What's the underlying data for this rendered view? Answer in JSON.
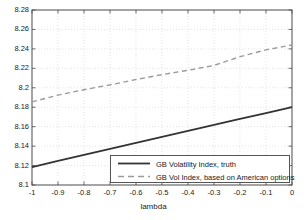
{
  "chart_data": {
    "type": "line",
    "title": "",
    "xlabel": "lambda",
    "ylabel": "",
    "xlim": [
      -1,
      0
    ],
    "ylim": [
      8.1,
      8.28
    ],
    "grid": true,
    "grid_style": "dotted",
    "legend_position": "bottom-right",
    "xticks": [
      "-1",
      "-0.9",
      "-0.8",
      "-0.7",
      "-0.6",
      "-0.5",
      "-0.4",
      "-0.3",
      "-0.2",
      "-0.1",
      "0"
    ],
    "xtick_values": [
      -1,
      -0.9,
      -0.8,
      -0.7,
      -0.6,
      -0.5,
      -0.4,
      -0.3,
      -0.2,
      -0.1,
      0
    ],
    "yticks": [
      "8.1",
      "8.12",
      "8.14",
      "8.16",
      "8.18",
      "8.2",
      "8.22",
      "8.24",
      "8.26",
      "8.28"
    ],
    "ytick_values": [
      8.1,
      8.12,
      8.14,
      8.16,
      8.18,
      8.2,
      8.22,
      8.24,
      8.26,
      8.28
    ],
    "x": [
      -1,
      -0.9,
      -0.8,
      -0.7,
      -0.6,
      -0.5,
      -0.4,
      -0.3,
      -0.2,
      -0.1,
      0
    ],
    "series": [
      {
        "name": "GB Volatility Index, truth",
        "style": "solid",
        "color": "#333333",
        "width": 1.8,
        "values": [
          8.1185,
          8.1247,
          8.1309,
          8.1371,
          8.1433,
          8.1495,
          8.1556,
          8.1618,
          8.1679,
          8.174,
          8.18
        ]
      },
      {
        "name": "GB Vol Index, based on American options",
        "style": "dashed",
        "color": "#9a9a9a",
        "width": 1.4,
        "values": [
          8.1855,
          8.1925,
          8.198,
          8.203,
          8.2085,
          8.2135,
          8.218,
          8.223,
          8.232,
          8.239,
          8.244
        ]
      }
    ]
  },
  "legend": {
    "entries": [
      {
        "label": "GB Volatility Index, truth"
      },
      {
        "label": "GB Vol Index, based on American options"
      }
    ]
  },
  "axes": {
    "x_label": "lambda"
  },
  "colors": {
    "axis": "#4a4a4a",
    "grid": "#d8d8d8",
    "series_solid": "#333333",
    "series_dashed": "#9a9a9a",
    "background": "#ffffff"
  }
}
